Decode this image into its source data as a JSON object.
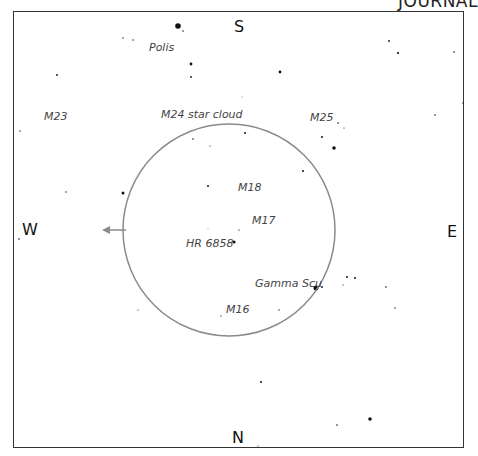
{
  "brand": "JOURNAL",
  "directions": {
    "south": "S",
    "north": "N",
    "west": "W",
    "east": "E"
  },
  "labels": {
    "polis": "Polis",
    "m23": "M23",
    "m24": "M24 star cloud",
    "m25": "M25",
    "m18": "M18",
    "m17": "M17",
    "hr6858": "HR 6858",
    "gamma_scu": "Gamma Scu",
    "m16": "M16"
  },
  "colors": {
    "frame": "#333333",
    "circle": "#8a8a8a",
    "arrow": "#8a8a8a",
    "star": "#111111",
    "label": "#444444"
  },
  "field_of_view": {
    "cx": 229,
    "cy": 230,
    "r": 106
  },
  "stars": [
    {
      "x": 178,
      "y": 26,
      "r": 2.8
    },
    {
      "x": 191,
      "y": 64,
      "r": 1.4
    },
    {
      "x": 191,
      "y": 77,
      "r": 0.9
    },
    {
      "x": 183,
      "y": 31,
      "r": 0.8
    },
    {
      "x": 133,
      "y": 40,
      "r": 0.7
    },
    {
      "x": 123,
      "y": 38,
      "r": 0.7
    },
    {
      "x": 280,
      "y": 72,
      "r": 1.4
    },
    {
      "x": 389,
      "y": 41,
      "r": 0.9
    },
    {
      "x": 398,
      "y": 53,
      "r": 1.1
    },
    {
      "x": 454,
      "y": 52,
      "r": 0.8
    },
    {
      "x": 463,
      "y": 103,
      "r": 0.7
    },
    {
      "x": 435,
      "y": 115,
      "r": 0.8
    },
    {
      "x": 57,
      "y": 75,
      "r": 0.9
    },
    {
      "x": 20,
      "y": 131,
      "r": 0.7
    },
    {
      "x": 334,
      "y": 148,
      "r": 1.8
    },
    {
      "x": 322,
      "y": 137,
      "r": 1.0
    },
    {
      "x": 338,
      "y": 123,
      "r": 0.8
    },
    {
      "x": 344,
      "y": 128,
      "r": 0.6
    },
    {
      "x": 245,
      "y": 133,
      "r": 1.0
    },
    {
      "x": 193,
      "y": 139,
      "r": 0.8
    },
    {
      "x": 210,
      "y": 146,
      "r": 0.6
    },
    {
      "x": 303,
      "y": 171,
      "r": 1.0
    },
    {
      "x": 208,
      "y": 186,
      "r": 1.0
    },
    {
      "x": 123,
      "y": 193,
      "r": 1.5
    },
    {
      "x": 66,
      "y": 192,
      "r": 0.7
    },
    {
      "x": 234,
      "y": 242,
      "r": 1.6
    },
    {
      "x": 316,
      "y": 288,
      "r": 2.5
    },
    {
      "x": 322,
      "y": 287,
      "r": 0.9
    },
    {
      "x": 347,
      "y": 277,
      "r": 1.0
    },
    {
      "x": 355,
      "y": 278,
      "r": 1.0
    },
    {
      "x": 343,
      "y": 285,
      "r": 0.6
    },
    {
      "x": 386,
      "y": 287,
      "r": 0.8
    },
    {
      "x": 395,
      "y": 308,
      "r": 0.7
    },
    {
      "x": 279,
      "y": 310,
      "r": 0.7
    },
    {
      "x": 138,
      "y": 310,
      "r": 0.6
    },
    {
      "x": 261,
      "y": 382,
      "r": 1.0
    },
    {
      "x": 370,
      "y": 419,
      "r": 1.8
    },
    {
      "x": 337,
      "y": 425,
      "r": 0.8
    },
    {
      "x": 258,
      "y": 446,
      "r": 0.6
    },
    {
      "x": 19,
      "y": 239,
      "r": 0.8
    }
  ],
  "faint_stars": [
    {
      "x": 239,
      "y": 230,
      "r": 1.2
    },
    {
      "x": 221,
      "y": 316,
      "r": 1.2
    },
    {
      "x": 242,
      "y": 97,
      "r": 0.8
    },
    {
      "x": 208,
      "y": 229,
      "r": 0.7
    }
  ]
}
